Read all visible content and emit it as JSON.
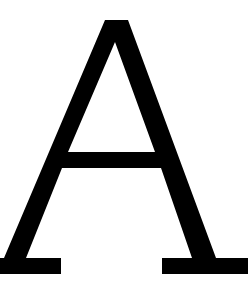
{
  "glyph": {
    "character": "A",
    "fill": "#000000",
    "background": "#ffffff"
  }
}
